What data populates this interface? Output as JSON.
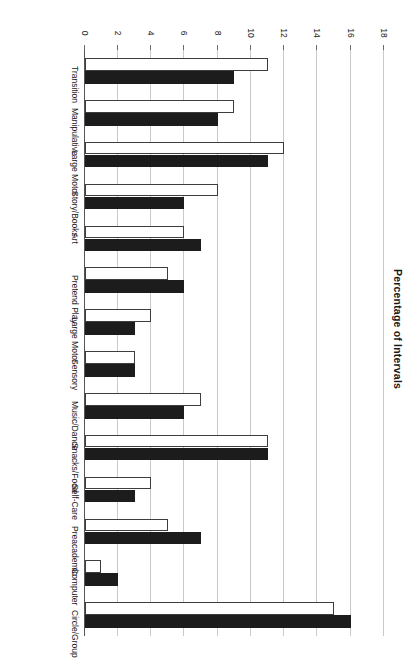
{
  "chart_data": {
    "type": "bar",
    "orientation": "horizontal",
    "title": "",
    "subtitle": "",
    "xlabel": "Percentage of Intervals",
    "ylabel": "",
    "axis_label": "Percentage of Intervals",
    "xlim": [
      0,
      18
    ],
    "ticks": [
      0,
      2,
      4,
      6,
      8,
      10,
      12,
      14,
      16,
      18
    ],
    "tick_labels": [
      "0",
      "2",
      "4",
      "6",
      "8",
      "10",
      "12",
      "14",
      "16",
      "18"
    ],
    "grid": true,
    "legend": [],
    "legend_position": "none",
    "rotation_note": "figure printed upside-down (180 degrees)",
    "categories": [
      "Circle/Group",
      "Computer",
      "Preacademic",
      "Self-Care",
      "Snacks/Food",
      "Music/Dance",
      "Sensory",
      "Large Motor",
      "Pretend Play",
      "Art",
      "Story/Books",
      "Large Motor",
      "Manipulative",
      "Transition"
    ],
    "series": [
      {
        "name": "Series 1",
        "style": "filled-black",
        "color": "#1c1c1c",
        "values": [
          16,
          2,
          7,
          3,
          11,
          6,
          3,
          3,
          6,
          7,
          6,
          11,
          8,
          9
        ]
      },
      {
        "name": "Series 2",
        "style": "open-white",
        "color": "#ffffff",
        "values": [
          15,
          1,
          5,
          4,
          11,
          7,
          3,
          4,
          5,
          6,
          8,
          12,
          9,
          11
        ]
      }
    ]
  },
  "figure": {
    "background": "#ffffff",
    "gridline_color": "#c9c9c9",
    "axis_color": "#555555"
  }
}
